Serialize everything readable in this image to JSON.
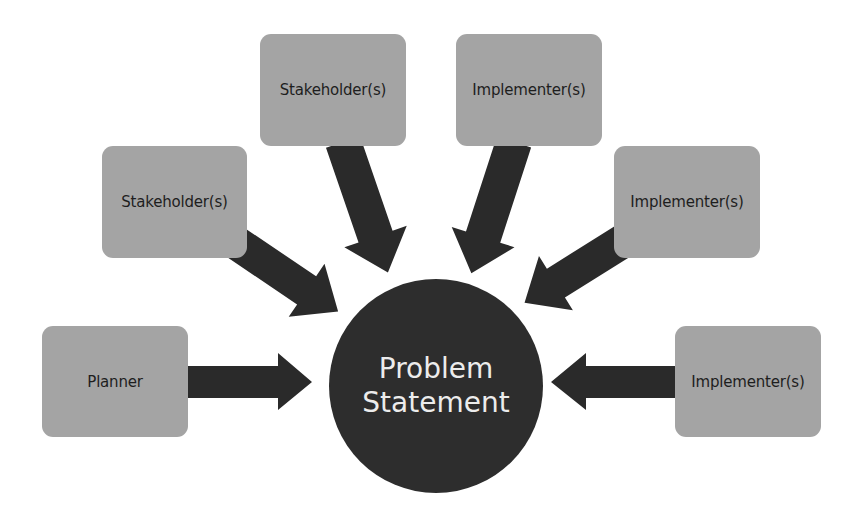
{
  "diagram": {
    "type": "hub-and-spoke",
    "colors": {
      "box_fill": "#a4a4a4",
      "box_text": "#1e1e1e",
      "arrow_fill": "#2a2a2a",
      "center_fill": "#2d2d2d",
      "center_text": "#ececec",
      "background": "#ffffff"
    },
    "center": {
      "line1": "Problem",
      "line2": "Statement"
    },
    "nodes": [
      {
        "id": "planner",
        "label": "Planner"
      },
      {
        "id": "stakeholder-left",
        "label": "Stakeholder(s)"
      },
      {
        "id": "stakeholder-top",
        "label": "Stakeholder(s)"
      },
      {
        "id": "implementer-top",
        "label": "Implementer(s)"
      },
      {
        "id": "implementer-right-upper",
        "label": "Implementer(s)"
      },
      {
        "id": "implementer-right-lower",
        "label": "Implementer(s)"
      }
    ],
    "edges": [
      {
        "from": "planner",
        "to": "center"
      },
      {
        "from": "stakeholder-left",
        "to": "center"
      },
      {
        "from": "stakeholder-top",
        "to": "center"
      },
      {
        "from": "implementer-top",
        "to": "center"
      },
      {
        "from": "implementer-right-upper",
        "to": "center"
      },
      {
        "from": "implementer-right-lower",
        "to": "center"
      }
    ]
  }
}
